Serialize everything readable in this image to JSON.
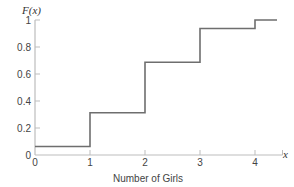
{
  "chart_data": {
    "type": "line",
    "subtype": "step",
    "title": "",
    "xlabel": "Number of Girls",
    "ylabel": "F(x)",
    "x_axis_symbol": "x",
    "xlim": [
      0,
      4.5
    ],
    "ylim": [
      0,
      1
    ],
    "grid": false,
    "legend": null,
    "x_ticks": [
      "0",
      "1",
      "2",
      "3",
      "4"
    ],
    "y_ticks": [
      "0",
      "0.2",
      "0.4",
      "0.6",
      "0.8",
      "1"
    ],
    "series": [
      {
        "name": "F(x)",
        "steps": [
          {
            "x_start": 0,
            "x_end": 1,
            "value": 0.0625
          },
          {
            "x_start": 1,
            "x_end": 2,
            "value": 0.3125
          },
          {
            "x_start": 2,
            "x_end": 3,
            "value": 0.6875
          },
          {
            "x_start": 3,
            "x_end": 4,
            "value": 0.9375
          },
          {
            "x_start": 4,
            "x_end": 4.4,
            "value": 1.0
          }
        ]
      }
    ],
    "colors": {
      "line": "#6e6e6e",
      "axis": "#bdbdbd",
      "text": "#444444"
    }
  }
}
